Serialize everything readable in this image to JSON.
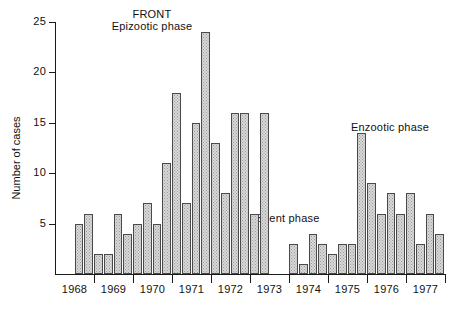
{
  "chart_data": {
    "type": "bar",
    "title": "FRONT",
    "subtitle": "Epizootic phase",
    "xlabel": "",
    "ylabel": "Number of cases",
    "ylim": [
      0,
      25
    ],
    "yticks": [
      5,
      10,
      15,
      20,
      25
    ],
    "grid": false,
    "legend": "none",
    "bar_fill": "#d8d8d8",
    "bar_edge": "#4a4a4a",
    "axis_color": "#1a1a1a",
    "xtick_labels": [
      "1968",
      "1969",
      "1970",
      "1971",
      "1972",
      "1973",
      "1974",
      "1975",
      "1976",
      "1977"
    ],
    "annotations": [
      {
        "text": "FRONT",
        "phase": "title"
      },
      {
        "text": "Epizootic phase",
        "phase": "epizootic"
      },
      {
        "text": "Silent phase",
        "phase": "silent"
      },
      {
        "text": "Enzootic phase",
        "phase": "enzootic"
      }
    ],
    "bar_notes": "Quarterly counts; slot index 0 = first quarter of 1968. Empty slots are gaps with no bar.",
    "slots_per_year": 4,
    "bars": [
      {
        "slot": 2,
        "value": 5,
        "year": 1968
      },
      {
        "slot": 3,
        "value": 6,
        "year": 1968
      },
      {
        "slot": 4,
        "value": 2,
        "year": 1969
      },
      {
        "slot": 5,
        "value": 2,
        "year": 1969
      },
      {
        "slot": 6,
        "value": 6,
        "year": 1969
      },
      {
        "slot": 7,
        "value": 4,
        "year": 1969
      },
      {
        "slot": 8,
        "value": 5,
        "year": 1970
      },
      {
        "slot": 9,
        "value": 7,
        "year": 1970
      },
      {
        "slot": 10,
        "value": 5,
        "year": 1970
      },
      {
        "slot": 11,
        "value": 11,
        "year": 1970
      },
      {
        "slot": 12,
        "value": 18,
        "year": 1971
      },
      {
        "slot": 13,
        "value": 7,
        "year": 1971
      },
      {
        "slot": 14,
        "value": 15,
        "year": 1971
      },
      {
        "slot": 15,
        "value": 24,
        "year": 1971
      },
      {
        "slot": 16,
        "value": 13,
        "year": 1972
      },
      {
        "slot": 17,
        "value": 8,
        "year": 1972
      },
      {
        "slot": 18,
        "value": 16,
        "year": 1972
      },
      {
        "slot": 19,
        "value": 16,
        "year": 1972
      },
      {
        "slot": 20,
        "value": 6,
        "year": 1973
      },
      {
        "slot": 21,
        "value": 16,
        "year": 1973
      },
      {
        "slot": 24,
        "value": 3,
        "year": 1974
      },
      {
        "slot": 25,
        "value": 1,
        "year": 1974
      },
      {
        "slot": 26,
        "value": 4,
        "year": 1974
      },
      {
        "slot": 27,
        "value": 3,
        "year": 1974
      },
      {
        "slot": 28,
        "value": 2,
        "year": 1975
      },
      {
        "slot": 29,
        "value": 3,
        "year": 1975
      },
      {
        "slot": 30,
        "value": 3,
        "year": 1975
      },
      {
        "slot": 31,
        "value": 14,
        "year": 1975
      },
      {
        "slot": 32,
        "value": 9,
        "year": 1976
      },
      {
        "slot": 33,
        "value": 6,
        "year": 1976
      },
      {
        "slot": 34,
        "value": 8,
        "year": 1976
      },
      {
        "slot": 35,
        "value": 6,
        "year": 1976
      },
      {
        "slot": 36,
        "value": 8,
        "year": 1977
      },
      {
        "slot": 37,
        "value": 3,
        "year": 1977
      },
      {
        "slot": 38,
        "value": 6,
        "year": 1977
      },
      {
        "slot": 39,
        "value": 4,
        "year": 1977
      }
    ]
  },
  "labels": {
    "title": "FRONT",
    "subtitle": "Epizootic phase",
    "silent_phase": "Silent phase",
    "enzootic_phase": "Enzootic phase",
    "y_axis_title": "Number of cases"
  }
}
